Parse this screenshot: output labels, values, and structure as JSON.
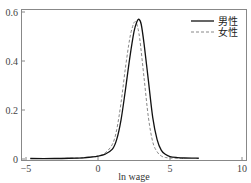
{
  "chart_data": {
    "type": "line",
    "title": "",
    "xlabel": "ln wage",
    "ylabel": "",
    "xlim": [
      -5,
      10
    ],
    "ylim": [
      0,
      0.6
    ],
    "x_ticks": [
      -5,
      0,
      5,
      10
    ],
    "x_tick_labels": [
      "−5",
      "0",
      "5",
      "10"
    ],
    "y_ticks": [
      0,
      0.2,
      0.4,
      0.6
    ],
    "y_tick_labels": [
      "0",
      "0.2",
      "0.4",
      "0.6"
    ],
    "grid": false,
    "legend_position": "upper right",
    "series": [
      {
        "name": "男性",
        "style": "solid",
        "color": "#111111",
        "x": [
          -4.7,
          -3,
          -2,
          -1,
          -0.5,
          0,
          0.5,
          1.0,
          1.3,
          1.6,
          1.9,
          2.2,
          2.5,
          2.7,
          2.85,
          3.0,
          3.2,
          3.5,
          3.8,
          4.1,
          4.4,
          4.7,
          5.0,
          5.5,
          6.0,
          7.0
        ],
        "y": [
          0.002,
          0.002,
          0.003,
          0.005,
          0.008,
          0.012,
          0.02,
          0.04,
          0.08,
          0.16,
          0.28,
          0.41,
          0.52,
          0.56,
          0.57,
          0.55,
          0.47,
          0.32,
          0.17,
          0.08,
          0.035,
          0.018,
          0.01,
          0.006,
          0.004,
          0.003
        ]
      },
      {
        "name": "女性",
        "style": "dashed",
        "color": "#888888",
        "x": [
          -4.7,
          -3,
          -2,
          -1,
          -0.5,
          0,
          0.5,
          1.0,
          1.3,
          1.6,
          1.9,
          2.2,
          2.4,
          2.55,
          2.7,
          2.9,
          3.2,
          3.5,
          3.8,
          4.1,
          4.4,
          4.7,
          5.0,
          5.5,
          6.0
        ],
        "y": [
          0.002,
          0.002,
          0.003,
          0.005,
          0.008,
          0.012,
          0.025,
          0.06,
          0.12,
          0.23,
          0.37,
          0.49,
          0.54,
          0.56,
          0.55,
          0.49,
          0.33,
          0.17,
          0.07,
          0.03,
          0.012,
          0.006,
          0.004,
          0.003,
          0.002
        ]
      }
    ]
  },
  "legend": {
    "items": [
      {
        "label": "男性",
        "style": "solid"
      },
      {
        "label": "女性",
        "style": "dashed"
      }
    ]
  }
}
